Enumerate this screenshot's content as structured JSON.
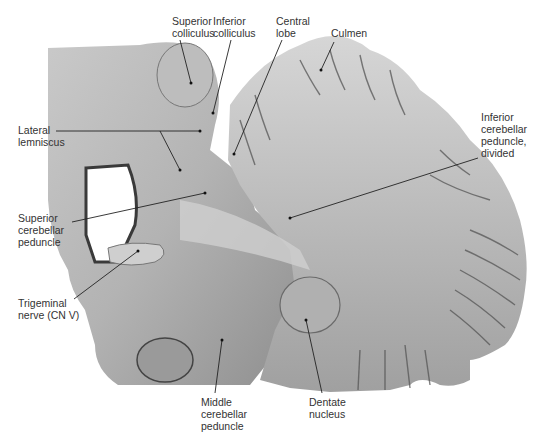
{
  "figure": {
    "background": "#ffffff",
    "specimen_base_color": "#a8a8a8",
    "label_color": "#333333",
    "leader_color": "#222222"
  },
  "labels": [
    {
      "id": "superior-colliculus",
      "text": "Superior\ncolliculus",
      "x": 172,
      "y": 17,
      "anchor": [
        191,
        83
      ],
      "line_from": [
        180,
        40
      ]
    },
    {
      "id": "inferior-colliculus",
      "text": "Inferior\ncolliculus",
      "x": 213,
      "y": 17,
      "anchor": [
        213,
        113
      ],
      "line_from": [
        231,
        40
      ]
    },
    {
      "id": "central-lobe",
      "text": "Central\nlobe",
      "x": 276,
      "y": 17,
      "anchor": [
        234,
        154
      ],
      "line_from": [
        282,
        40
      ]
    },
    {
      "id": "culmen",
      "text": "Culmen",
      "x": 330,
      "y": 28,
      "anchor": [
        321,
        70
      ],
      "line_from": [
        334,
        42
      ]
    },
    {
      "id": "lateral-lemniscus",
      "text": "Lateral\nlemniscus",
      "x": 18,
      "y": 125,
      "anchor": [
        200,
        131
      ],
      "line_from": [
        56,
        131
      ]
    },
    {
      "id": "inferior-cerebellar-peduncle",
      "text": "Inferior\ncerebellar\npeduncle,\ndivided",
      "x": 481,
      "y": 113,
      "anchor": [
        290,
        218
      ],
      "line_from": [
        478,
        158
      ]
    },
    {
      "id": "superior-cerebellar-peduncle",
      "text": "Superior\ncerebellar\npeduncle",
      "x": 18,
      "y": 214,
      "anchor": [
        205,
        193
      ],
      "line_from": [
        72,
        222
      ]
    },
    {
      "id": "trigeminal-nerve",
      "text": "Trigeminal\nnerve (CN V)",
      "x": 18,
      "y": 299,
      "anchor": [
        138,
        251
      ],
      "line_from": [
        74,
        299
      ]
    },
    {
      "id": "middle-cerebellar-peduncle",
      "text": "Middle\ncerebellar\npeduncle",
      "x": 201,
      "y": 398,
      "anchor": [
        222,
        340
      ],
      "line_from": [
        215,
        393
      ]
    },
    {
      "id": "dentate-nucleus",
      "text": "Dentate\nnucleus",
      "x": 309,
      "y": 398,
      "anchor": [
        306,
        320
      ],
      "line_from": [
        322,
        393
      ]
    },
    {
      "id": "lateral-lemniscus-2",
      "text": "",
      "x": 0,
      "y": 0,
      "anchor": [
        180,
        170
      ],
      "line_from": [
        160,
        131
      ]
    }
  ]
}
